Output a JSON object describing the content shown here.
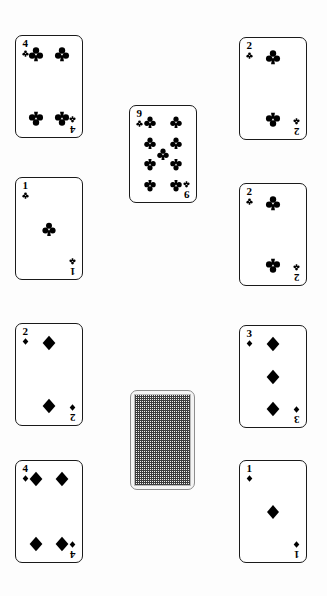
{
  "scene": {
    "name": "playing-card-layout",
    "background_color": "#fdfdfd",
    "width": 327,
    "height": 596,
    "card_width": 68,
    "card_height": 103
  },
  "suits": {
    "clubs": {
      "name": "club-suit",
      "glyph": "♣",
      "color": "#000000"
    },
    "diamonds": {
      "name": "diamond-suit",
      "glyph": "♦",
      "color": "#000000"
    }
  },
  "cards": [
    {
      "id": "card-4-clubs",
      "rank": "4",
      "suit": "clubs",
      "suit_glyph": "♣",
      "face_up": true,
      "x": 15,
      "y": 35,
      "w": 68,
      "h": 103,
      "pips": [
        [
          30,
          18
        ],
        [
          70,
          18
        ],
        [
          30,
          82
        ],
        [
          70,
          82
        ]
      ]
    },
    {
      "id": "card-2-clubs-top",
      "rank": "2",
      "suit": "clubs",
      "suit_glyph": "♣",
      "face_up": true,
      "x": 239,
      "y": 37,
      "w": 68,
      "h": 103,
      "pips": [
        [
          50,
          19
        ],
        [
          50,
          81
        ]
      ]
    },
    {
      "id": "card-9-clubs",
      "rank": "9",
      "suit": "clubs",
      "suit_glyph": "♣",
      "face_up": true,
      "x": 129,
      "y": 105,
      "w": 68,
      "h": 98,
      "pips": [
        [
          30,
          17
        ],
        [
          70,
          17
        ],
        [
          30,
          39
        ],
        [
          70,
          39
        ],
        [
          50,
          50
        ],
        [
          30,
          61
        ],
        [
          70,
          61
        ],
        [
          30,
          83
        ],
        [
          70,
          83
        ]
      ]
    },
    {
      "id": "card-ace-clubs",
      "rank": "1",
      "suit": "clubs",
      "suit_glyph": "♣",
      "face_up": true,
      "x": 15,
      "y": 177,
      "w": 68,
      "h": 103,
      "pips": [
        [
          50,
          50
        ]
      ]
    },
    {
      "id": "card-2-clubs-mid",
      "rank": "2",
      "suit": "clubs",
      "suit_glyph": "♣",
      "face_up": true,
      "x": 239,
      "y": 183,
      "w": 68,
      "h": 103,
      "pips": [
        [
          50,
          19
        ],
        [
          50,
          81
        ]
      ]
    },
    {
      "id": "card-2-diamonds",
      "rank": "2",
      "suit": "diamonds",
      "suit_glyph": "♦",
      "face_up": true,
      "x": 15,
      "y": 323,
      "w": 68,
      "h": 103,
      "pips": [
        [
          50,
          19
        ],
        [
          50,
          81
        ]
      ]
    },
    {
      "id": "card-3-diamonds",
      "rank": "3",
      "suit": "diamonds",
      "suit_glyph": "♦",
      "face_up": true,
      "x": 239,
      "y": 325,
      "w": 68,
      "h": 103,
      "pips": [
        [
          50,
          18
        ],
        [
          50,
          50
        ],
        [
          50,
          82
        ]
      ]
    },
    {
      "id": "card-4-diamonds",
      "rank": "4",
      "suit": "diamonds",
      "suit_glyph": "♦",
      "face_up": true,
      "x": 15,
      "y": 460,
      "w": 68,
      "h": 103,
      "pips": [
        [
          30,
          18
        ],
        [
          70,
          18
        ],
        [
          30,
          82
        ],
        [
          70,
          82
        ]
      ]
    },
    {
      "id": "card-ace-diamonds",
      "rank": "1",
      "suit": "diamonds",
      "suit_glyph": "♦",
      "face_up": true,
      "x": 239,
      "y": 460,
      "w": 68,
      "h": 103,
      "pips": [
        [
          50,
          50
        ]
      ]
    }
  ],
  "card_back": {
    "id": "card-back-facedown",
    "face_up": false,
    "x": 130,
    "y": 390,
    "w": 65,
    "h": 100,
    "pattern": "crosshatch-weave",
    "border_color": "#8d8d8d",
    "pattern_color": "#3b3b3b"
  }
}
